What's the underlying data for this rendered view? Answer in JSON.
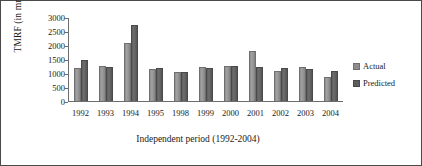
{
  "chart_data": {
    "type": "bar",
    "title": "",
    "xlabel": "Independent period (1992-2004)",
    "ylabel": "TMRF (in mm.)",
    "categories": [
      "1992",
      "1993",
      "1994",
      "1995",
      "1998",
      "1999",
      "2000",
      "2001",
      "2002",
      "2003",
      "2004"
    ],
    "series": [
      {
        "name": "Actual",
        "color": "#8d8d8d",
        "values": [
          1180,
          1250,
          2080,
          1140,
          1050,
          1210,
          1240,
          1790,
          1070,
          1220,
          860
        ]
      },
      {
        "name": "Predicted",
        "color": "#5d5d5d",
        "values": [
          1470,
          1210,
          2700,
          1170,
          1030,
          1180,
          1240,
          1230,
          1180,
          1130,
          1070
        ]
      }
    ],
    "ylim": [
      0,
      3000
    ],
    "yticks": [
      0,
      500,
      1000,
      1500,
      2000,
      2500,
      3000
    ],
    "ytick_labels": [
      "0",
      "500",
      "1000",
      "1500",
      "2000",
      "2500",
      "3000"
    ],
    "grid": false,
    "legend_position": "right"
  },
  "legend": {
    "items": [
      {
        "label": "Actual"
      },
      {
        "label": "Predicted"
      }
    ]
  }
}
